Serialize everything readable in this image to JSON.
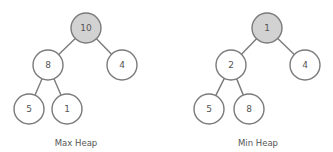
{
  "diagrams": [
    {
      "caption": "Max Heap",
      "nodes": [
        {
          "id": "root",
          "value": "10",
          "x": 86,
          "y": 28,
          "highlighted": true
        },
        {
          "id": "l",
          "value": "8",
          "x": 48,
          "y": 65,
          "highlighted": false
        },
        {
          "id": "r",
          "value": "4",
          "x": 122,
          "y": 65,
          "highlighted": false
        },
        {
          "id": "ll",
          "value": "5",
          "x": 29,
          "y": 109,
          "highlighted": false
        },
        {
          "id": "lr",
          "value": "1",
          "x": 67,
          "y": 109,
          "highlighted": false
        }
      ],
      "edges": [
        [
          "root",
          "l"
        ],
        [
          "root",
          "r"
        ],
        [
          "l",
          "ll"
        ],
        [
          "l",
          "lr"
        ]
      ],
      "caption_pos": {
        "x": 76,
        "y": 146
      }
    },
    {
      "caption": "Min Heap",
      "nodes": [
        {
          "id": "root",
          "value": "1",
          "x": 267,
          "y": 28,
          "highlighted": true
        },
        {
          "id": "l",
          "value": "2",
          "x": 231,
          "y": 65,
          "highlighted": false
        },
        {
          "id": "r",
          "value": "4",
          "x": 305,
          "y": 65,
          "highlighted": false
        },
        {
          "id": "ll",
          "value": "5",
          "x": 209,
          "y": 109,
          "highlighted": false
        },
        {
          "id": "lr",
          "value": "8",
          "x": 249,
          "y": 109,
          "highlighted": false
        }
      ],
      "edges": [
        [
          "root",
          "l"
        ],
        [
          "root",
          "r"
        ],
        [
          "l",
          "ll"
        ],
        [
          "l",
          "lr"
        ]
      ],
      "caption_pos": {
        "x": 258,
        "y": 146
      }
    }
  ],
  "style": {
    "node_radius": 15,
    "root_fill": "#d2d2d2",
    "stroke": "#7a7a7a"
  }
}
